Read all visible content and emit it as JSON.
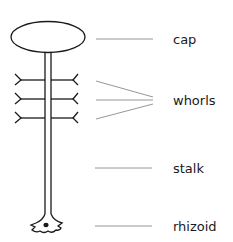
{
  "diagram": {
    "colors": {
      "ink": "#1a1a1a",
      "leader": "#8a8a8a",
      "background": "#ffffff"
    },
    "labels": [
      {
        "id": "cap",
        "text": "cap",
        "x": 173,
        "y": 44
      },
      {
        "id": "whorls",
        "text": "whorls",
        "x": 173,
        "y": 105
      },
      {
        "id": "stalk",
        "text": "stalk",
        "x": 173,
        "y": 173
      },
      {
        "id": "rhizoid",
        "text": "rhizoid",
        "x": 173,
        "y": 231
      }
    ]
  }
}
